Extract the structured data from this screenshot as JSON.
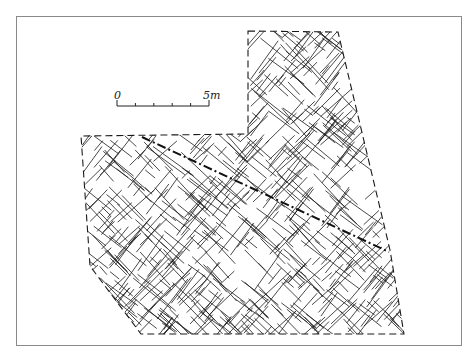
{
  "figure": {
    "type": "fracture-map",
    "frame": {
      "x": 16,
      "y": 16,
      "width": 446,
      "height": 330,
      "border_color": "#8a8a8a"
    },
    "ink_color": "#1a1a1a"
  },
  "scale_bar": {
    "start_label": "0",
    "end_label": "5m",
    "x1": 117,
    "x2": 209,
    "y": 106,
    "ticks": 5
  },
  "boundary": {
    "style": "dashed",
    "points": [
      [
        248,
        31
      ],
      [
        338,
        32
      ],
      [
        390,
        250
      ],
      [
        404,
        334
      ],
      [
        141,
        334
      ],
      [
        90,
        266
      ],
      [
        81,
        136
      ],
      [
        248,
        134
      ]
    ]
  },
  "fault_line": {
    "style": "dash-dot",
    "from": [
      142,
      137
    ],
    "to": [
      389,
      252
    ]
  },
  "fractures": {
    "description": "Dense network of short intersecting cracks in two dominant orientations (NE-SW and NW-SE), filling the dashed boundary region",
    "orientations_deg": [
      45,
      -40
    ]
  }
}
